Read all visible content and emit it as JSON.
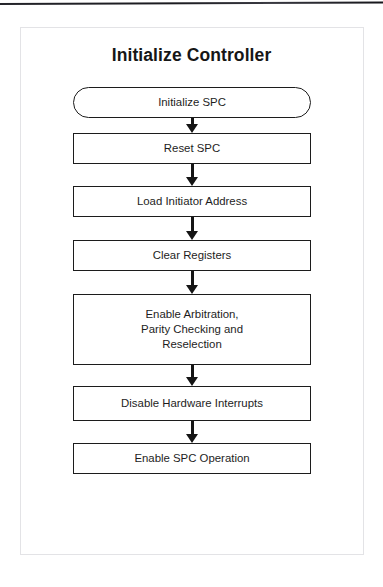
{
  "figure": {
    "title": "Initialize Controller",
    "type": "flowchart",
    "orientation": "top-to-bottom",
    "colors": {
      "node_border": "#1c1c1c",
      "node_fill": "#ffffff",
      "text": "#1d1d1d",
      "arrow": "#151515",
      "frame": "#e3e3e6",
      "page_rule": "#1b1b20"
    },
    "nodes": [
      {
        "id": "n1",
        "label": "Initialize SPC",
        "shape": "terminator",
        "x": 73,
        "y": 87,
        "width": 238,
        "height": 31
      },
      {
        "id": "n2",
        "label": "Reset SPC",
        "shape": "rectangle",
        "x": 73,
        "y": 133,
        "width": 238,
        "height": 31
      },
      {
        "id": "n3",
        "label": "Load Initiator Address",
        "shape": "rectangle",
        "x": 73,
        "y": 186,
        "width": 238,
        "height": 31
      },
      {
        "id": "n4",
        "label": "Clear Registers",
        "shape": "rectangle",
        "x": 73,
        "y": 240,
        "width": 238,
        "height": 31
      },
      {
        "id": "n5",
        "label": "Enable Arbitration,\nParity Checking and\nReselection",
        "shape": "rectangle",
        "x": 73,
        "y": 294,
        "width": 238,
        "height": 71
      },
      {
        "id": "n6",
        "label": "Disable Hardware Interrupts",
        "shape": "rectangle",
        "x": 73,
        "y": 386,
        "width": 238,
        "height": 35
      },
      {
        "id": "n7",
        "label": "Enable SPC Operation",
        "shape": "rectangle",
        "x": 73,
        "y": 443,
        "width": 238,
        "height": 31
      }
    ],
    "edges": [
      {
        "from": "n1",
        "to": "n2",
        "arrow": "down",
        "y": 118,
        "height": 15
      },
      {
        "from": "n2",
        "to": "n3",
        "arrow": "down",
        "y": 164,
        "height": 22
      },
      {
        "from": "n3",
        "to": "n4",
        "arrow": "down",
        "y": 217,
        "height": 23
      },
      {
        "from": "n4",
        "to": "n5",
        "arrow": "down",
        "y": 271,
        "height": 23
      },
      {
        "from": "n5",
        "to": "n6",
        "arrow": "down",
        "y": 365,
        "height": 21
      },
      {
        "from": "n6",
        "to": "n7",
        "arrow": "down",
        "y": 421,
        "height": 22
      }
    ]
  }
}
